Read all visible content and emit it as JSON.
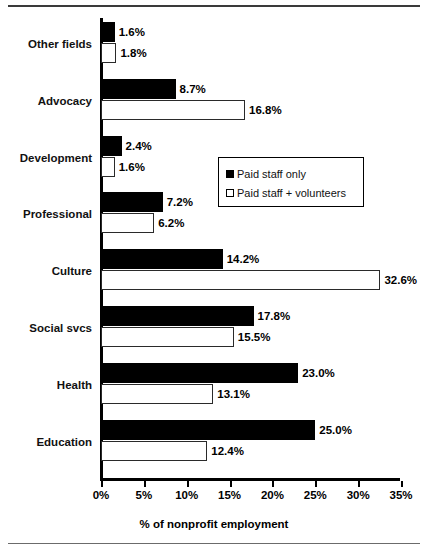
{
  "chart_data": {
    "type": "bar",
    "orientation": "horizontal",
    "title": "",
    "xlabel": "% of nonprofit employment",
    "ylabel": "",
    "xlim": [
      0,
      35
    ],
    "xticks": [
      "0%",
      "5%",
      "10%",
      "15%",
      "20%",
      "25%",
      "30%",
      "35%"
    ],
    "xtick_values": [
      0,
      5,
      10,
      15,
      20,
      25,
      30,
      35
    ],
    "grid": false,
    "legend_position": "center-right-inset",
    "categories": [
      "Other fields",
      "Advocacy",
      "Development",
      "Professional",
      "Culture",
      "Social svcs",
      "Health",
      "Education"
    ],
    "series": [
      {
        "name": "Paid staff only",
        "color": "#000000",
        "style": "filled",
        "values": [
          1.6,
          8.7,
          2.4,
          7.2,
          14.2,
          17.8,
          23.0,
          25.0
        ],
        "labels": [
          "1.6%",
          "8.7%",
          "2.4%",
          "7.2%",
          "14.2%",
          "17.8%",
          "23.0%",
          "25.0%"
        ]
      },
      {
        "name": "Paid staff + volunteers",
        "color": "#ffffff",
        "style": "hollow",
        "values": [
          1.8,
          16.8,
          1.6,
          6.2,
          32.6,
          15.5,
          13.1,
          12.4
        ],
        "labels": [
          "1.8%",
          "16.8%",
          "1.6%",
          "6.2%",
          "32.6%",
          "15.5%",
          "13.1%",
          "12.4%"
        ]
      }
    ]
  }
}
